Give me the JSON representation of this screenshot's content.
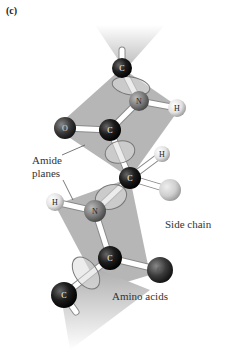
{
  "figure": {
    "panel_label": "(c)",
    "labels": {
      "amide_line1": "Amide",
      "amide_line2": "planes",
      "side_chain": "Side chain",
      "amino_acids": "Amino acids"
    },
    "atoms": [
      {
        "id": "c1",
        "symbol": "C",
        "x": 122,
        "y": 68,
        "r": 10,
        "color": "#1a1a1a"
      },
      {
        "id": "n1",
        "symbol": "N",
        "x": 139,
        "y": 101,
        "r": 10,
        "color": "#7a7a7a"
      },
      {
        "id": "h1",
        "symbol": "H",
        "x": 177,
        "y": 108,
        "r": 9,
        "color": "#e6e6e6"
      },
      {
        "id": "o1",
        "symbol": "O",
        "x": 65,
        "y": 128,
        "r": 11,
        "color": "#444444"
      },
      {
        "id": "c2",
        "symbol": "C",
        "x": 110,
        "y": 130,
        "r": 11,
        "color": "#1a1a1a"
      },
      {
        "id": "h2",
        "symbol": "H",
        "x": 162,
        "y": 154,
        "r": 8,
        "color": "#e6e6e6"
      },
      {
        "id": "ca",
        "symbol": "C",
        "x": 130,
        "y": 178,
        "r": 11,
        "color": "#1a1a1a"
      },
      {
        "id": "r1",
        "symbol": "",
        "x": 170,
        "y": 190,
        "r": 11,
        "color": "#d0d0d0"
      },
      {
        "id": "h3",
        "symbol": "H",
        "x": 55,
        "y": 202,
        "r": 9,
        "color": "#e6e6e6"
      },
      {
        "id": "n2",
        "symbol": "N",
        "x": 95,
        "y": 211,
        "r": 11,
        "color": "#7a7a7a"
      },
      {
        "id": "c3",
        "symbol": "C",
        "x": 110,
        "y": 258,
        "r": 12,
        "color": "#1a1a1a"
      },
      {
        "id": "o2",
        "symbol": "O",
        "x": 160,
        "y": 270,
        "r": 13,
        "color": "#333333"
      },
      {
        "id": "c4",
        "symbol": "C",
        "x": 64,
        "y": 295,
        "r": 13,
        "color": "#1a1a1a"
      }
    ],
    "colors": {
      "plane": "#a9a9a9",
      "bond": "#ffffff",
      "bond_edge": "#8a8a8a",
      "text": "#333333"
    }
  }
}
